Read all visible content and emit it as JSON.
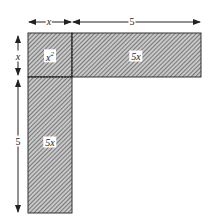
{
  "diagram": {
    "regions": [
      {
        "id": "square",
        "label": "x²",
        "label_base": "x",
        "label_sup": "2"
      },
      {
        "id": "top-rect",
        "label": "5x"
      },
      {
        "id": "left-rect",
        "label": "5x"
      }
    ],
    "dimensions": {
      "top_left": "x",
      "top_right": "5",
      "left_top": "x",
      "left_bottom": "5"
    },
    "colors": {
      "stroke": "#333333",
      "hatch": "#555555",
      "fill": "#bdbdbd"
    }
  }
}
